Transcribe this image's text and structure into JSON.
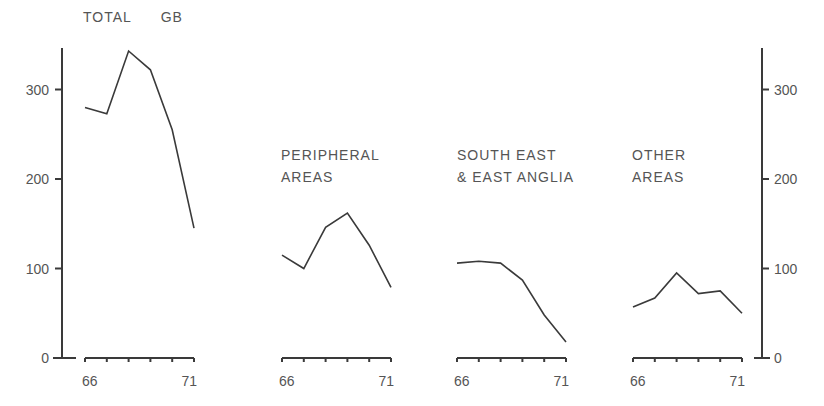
{
  "chart_data": {
    "type": "line",
    "ylim": [
      0,
      350
    ],
    "y_ticks": [
      0,
      100,
      200,
      300
    ],
    "y_tick_labels": [
      "0",
      "100",
      "200",
      "300"
    ],
    "x": [
      66,
      67,
      68,
      69,
      70,
      71
    ],
    "x_tick_labels": [
      "66",
      "71"
    ],
    "grid": false,
    "legend": "none",
    "panels": [
      {
        "title": "TOTAL GB",
        "title_lines": [
          "TOTAL      GB"
        ],
        "values": [
          280,
          273,
          343,
          322,
          255,
          145
        ]
      },
      {
        "title": "PERIPHERAL AREAS",
        "title_lines": [
          "PERIPHERAL",
          "AREAS"
        ],
        "values": [
          115,
          100,
          146,
          162,
          126,
          79
        ]
      },
      {
        "title": "SOUTH EAST & EAST ANGLIA",
        "title_lines": [
          "SOUTH EAST",
          "& EAST ANGLIA"
        ],
        "values": [
          106,
          108,
          106,
          87,
          48,
          18
        ]
      },
      {
        "title": "OTHER AREAS",
        "title_lines": [
          "OTHER",
          "AREAS"
        ],
        "values": [
          57,
          67,
          95,
          72,
          75,
          50
        ]
      }
    ]
  },
  "colors": {
    "line": "#3a3a3a",
    "text": "#555555",
    "background": "#ffffff"
  }
}
